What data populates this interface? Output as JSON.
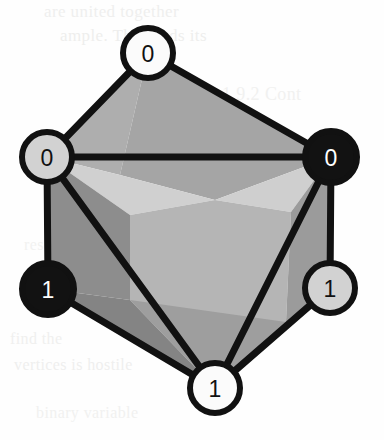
{
  "figure": {
    "background_color": "#fefefe",
    "edge_color": "#111111",
    "canvas": {
      "width": 384,
      "height": 440
    }
  },
  "palette": {
    "face_light": "#d7d7d7",
    "face_mid_light": "#c0c0c0",
    "face_mid": "#aeaeae",
    "face_mid_dark": "#9a9a9a",
    "face_dark": "#888888",
    "face_darkest": "#7c7c7c",
    "node_white": "#fbfbfb",
    "node_gray": "#d2d2d2",
    "node_black": "#121212",
    "outline": "#111111",
    "label_dark": "#111111",
    "label_light": "#ffffff"
  },
  "nodes": [
    {
      "id": "top",
      "label": "0",
      "fill": "#fbfbfb",
      "label_color": "#111111",
      "cx": 148,
      "cy": 53,
      "r": 25,
      "stroke_width": 6
    },
    {
      "id": "left",
      "label": "0",
      "fill": "#d2d2d2",
      "label_color": "#111111",
      "cx": 47,
      "cy": 157,
      "r": 25,
      "stroke_width": 6
    },
    {
      "id": "right",
      "label": "0",
      "fill": "#121212",
      "label_color": "#ffffff",
      "cx": 331,
      "cy": 157,
      "r": 26,
      "stroke_width": 6
    },
    {
      "id": "bottom-left",
      "label": "1",
      "fill": "#121212",
      "label_color": "#ffffff",
      "cx": 48,
      "cy": 289,
      "r": 26,
      "stroke_width": 6
    },
    {
      "id": "bottom-right",
      "label": "1",
      "fill": "#d2d2d2",
      "label_color": "#111111",
      "cx": 330,
      "cy": 288,
      "r": 25,
      "stroke_width": 6
    },
    {
      "id": "bottom-center",
      "label": "1",
      "fill": "#fbfbfb",
      "label_color": "#111111",
      "cx": 215,
      "cy": 388,
      "r": 25,
      "stroke_width": 6
    }
  ],
  "edges": [
    {
      "from": "top",
      "to": "left",
      "width": 7
    },
    {
      "from": "top",
      "to": "right",
      "width": 7
    },
    {
      "from": "left",
      "to": "right",
      "width": 7
    },
    {
      "from": "left",
      "to": "bottom-left",
      "width": 7
    },
    {
      "from": "left",
      "to": "bottom-center",
      "width": 7
    },
    {
      "from": "right",
      "to": "bottom-right",
      "width": 7
    },
    {
      "from": "right",
      "to": "bottom-center",
      "width": 7
    },
    {
      "from": "bottom-left",
      "to": "bottom-center",
      "width": 7
    },
    {
      "from": "bottom-right",
      "to": "bottom-center",
      "width": 7
    }
  ],
  "faces": [
    {
      "id": "face-top-left",
      "points": "148,53 47,157 120,175",
      "fill": "#aeaeae"
    },
    {
      "id": "face-top-main",
      "points": "148,53 331,157 215,200 120,175",
      "fill": "#a5a5a5"
    },
    {
      "id": "face-upper-left-hi",
      "points": "47,157 120,175 215,200 130,215",
      "fill": "#d0d0d0"
    },
    {
      "id": "face-upper-right-hi",
      "points": "331,157 291,212 215,200",
      "fill": "#cfcfcf"
    },
    {
      "id": "face-center-core",
      "points": "130,215 215,200 291,212 286,322 215,388 130,300",
      "fill": "#b5b5b5"
    },
    {
      "id": "face-left-wedge",
      "points": "47,157 130,215 130,300 48,289",
      "fill": "#8d8d8d"
    },
    {
      "id": "face-left-lower",
      "points": "48,289 130,300 215,388",
      "fill": "#848484"
    },
    {
      "id": "face-bottom-center",
      "points": "130,300 286,322 215,388",
      "fill": "#9e9e9e"
    },
    {
      "id": "face-right-wedge",
      "points": "331,157 291,212 286,322 330,288",
      "fill": "#9b9b9b"
    },
    {
      "id": "face-right-lower",
      "points": "286,322 330,288 215,388",
      "fill": "#8f8f8f"
    }
  ],
  "bleed_through": [
    {
      "text": "are united together",
      "x": 44,
      "y": 2,
      "size": 17,
      "color": "#efefee"
    },
    {
      "text": "ample. This finds its",
      "x": 60,
      "y": 26,
      "size": 17,
      "color": "#eeeeed"
    },
    {
      "text": "1.9.2 Cont",
      "x": 222,
      "y": 84,
      "size": 18,
      "color": "#f1f1f0"
    },
    {
      "text": "resent the",
      "x": 24,
      "y": 236,
      "size": 16,
      "color": "#f2f2f1"
    },
    {
      "text": "find the",
      "x": 10,
      "y": 330,
      "size": 16,
      "color": "#f0f0ef"
    },
    {
      "text": "vertices is hostile",
      "x": 14,
      "y": 356,
      "size": 16,
      "color": "#efefee"
    },
    {
      "text": "binary variable",
      "x": 36,
      "y": 404,
      "size": 16,
      "color": "#f1f1f0"
    }
  ]
}
